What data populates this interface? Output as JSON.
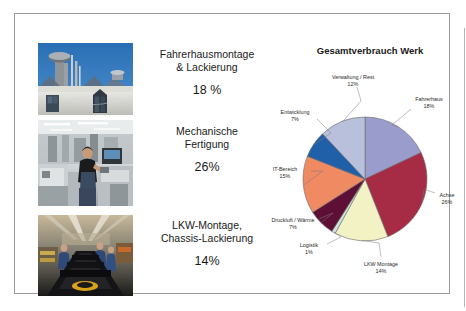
{
  "slide": {
    "photos": [
      {
        "name": "rooftop-ventilation-plant",
        "alt": "Industrieanlage Dachaufbauten mit Abluftschornsteinen vor blauem Himmel"
      },
      {
        "name": "machining-worker",
        "alt": "Mitarbeiter an Werkzeugmaschine in heller Fertigungshalle"
      },
      {
        "name": "assembly-line",
        "alt": "Mitarbeiter an der Montagelinie mit Chassis-Foerderband"
      }
    ],
    "captions": [
      {
        "title": "Fahrerhausmontage\n& Lackierung",
        "percent": "18 %"
      },
      {
        "title": "Mechanische\nFertigung",
        "percent": "26%"
      },
      {
        "title": "LKW-Montage,\nChassis-Lackierung",
        "percent": "14%"
      }
    ]
  },
  "chart_data": {
    "type": "pie",
    "title": "Gesamtverbrauch Werk",
    "xlabel": "",
    "ylabel": "",
    "legend_position": "none",
    "labels_outside": true,
    "categories": [
      "Fahrerhaus",
      "Achse",
      "LKW Montage",
      "Logistik",
      "Druckluft / Wärme",
      "IT-Bereich",
      "Entwicklung",
      "Verwaltung / Rest"
    ],
    "values": [
      18,
      26,
      14,
      1,
      7,
      15,
      7,
      12
    ],
    "value_labels": [
      "18%",
      "26%",
      "14%",
      "1%",
      "7%",
      "15%",
      "7%",
      "12%"
    ],
    "colors": [
      "#9a9ccb",
      "#a62c46",
      "#f2f2c4",
      "#cfe6e0",
      "#5e0f35",
      "#ef8a62",
      "#1f60a8",
      "#b9c0dc"
    ],
    "slice_border_color": "#6b6b6b",
    "start_angle_deg": -90,
    "direction": "clockwise"
  }
}
